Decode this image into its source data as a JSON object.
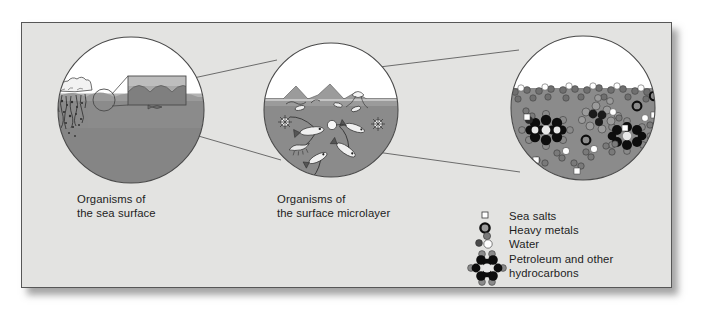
{
  "figure": {
    "panel_bg": "#e3e3e1",
    "border_color": "#575757",
    "water_color": "#8f8f8f",
    "deep_water_color": "#7e7e7e",
    "sky_color": "#ffffff",
    "outline_color": "#4a4a4a"
  },
  "panels": [
    {
      "id": "sea-surface",
      "caption": "Organisms of\nthe sea surface",
      "cx": 131,
      "cy": 110,
      "r": 73
    },
    {
      "id": "surface-microlayer",
      "caption": "Organisms of\nthe surface microlayer",
      "cx": 331,
      "cy": 110,
      "r": 67
    },
    {
      "id": "molecular-view",
      "caption": "",
      "cx": 583,
      "cy": 108,
      "r": 72
    }
  ],
  "legend": {
    "items": [
      {
        "icon": "sea-salt-square-icon",
        "label": "Sea salts"
      },
      {
        "icon": "heavy-metal-ring-icon",
        "label": "Heavy metals"
      },
      {
        "icon": "water-molecule-icon",
        "label": "Water"
      },
      {
        "icon": "hydrocarbon-molecule-icon",
        "label": "Petroleum and other\nhydrocarbons"
      }
    ]
  },
  "colors": {
    "salt_fill": "#ffffff",
    "metal_ring": "#101010",
    "water_oxygen": "#ffffff",
    "water_hydrogen": "#6b6b6b",
    "hydrocarbon_carbon": "#0d0d0d",
    "hydrocarbon_hydrogen": "#787878",
    "text": "#1d1d1d"
  }
}
